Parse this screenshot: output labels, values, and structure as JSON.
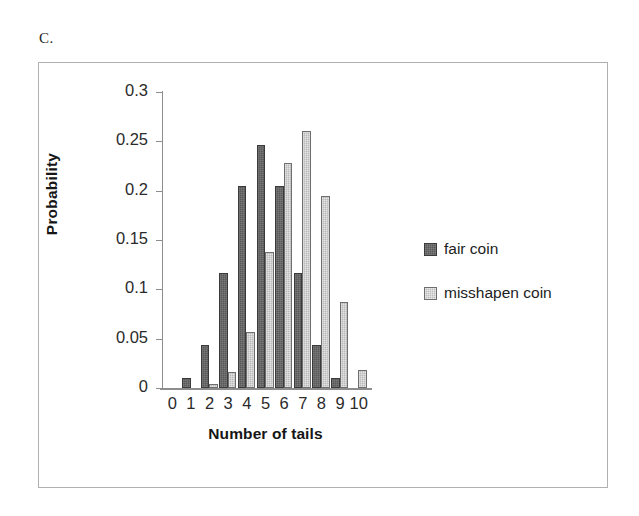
{
  "panel": {
    "letter": "C."
  },
  "chart_data": {
    "type": "bar",
    "title": "",
    "xlabel": "Number of tails",
    "ylabel": "Probability",
    "categories": [
      "0",
      "1",
      "2",
      "3",
      "4",
      "5",
      "6",
      "7",
      "8",
      "9",
      "10"
    ],
    "ylim": [
      0,
      0.3
    ],
    "ytick_labels": [
      "0.3",
      "0.25",
      "0.2",
      "0.15",
      "0.1",
      "0.05",
      "0"
    ],
    "ytick_values": [
      0.3,
      0.25,
      0.2,
      0.15,
      0.1,
      0.05,
      0
    ],
    "grid": false,
    "legend_position": "right",
    "series": [
      {
        "name": "fair coin",
        "color": "#585858",
        "values": [
          0.001,
          0.01,
          0.044,
          0.117,
          0.205,
          0.246,
          0.205,
          0.117,
          0.044,
          0.01,
          0.001
        ]
      },
      {
        "name": "misshapen coin",
        "color": "#b9b9b9",
        "values": [
          0.0,
          0.0,
          0.004,
          0.016,
          0.057,
          0.138,
          0.228,
          0.26,
          0.195,
          0.087,
          0.018
        ]
      }
    ]
  },
  "legend": {
    "items": [
      {
        "label": "fair coin",
        "swatch": "fair"
      },
      {
        "label": "misshapen coin",
        "swatch": "misshapen"
      }
    ]
  }
}
